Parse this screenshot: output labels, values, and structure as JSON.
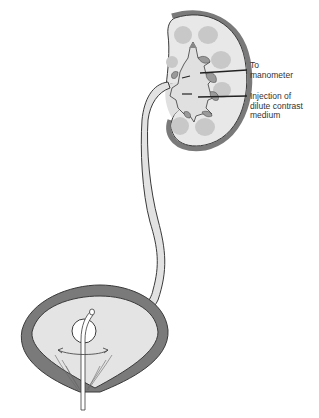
{
  "diagram": {
    "type": "anatomical-illustration",
    "labels": [
      {
        "id": "to-manometer",
        "text": "To\nmanometer"
      },
      {
        "id": "injection",
        "text": "Injection of\ndilute contrast\nmedium"
      }
    ],
    "colors": {
      "outline": "#3a3a3a",
      "tissue_light": "#e4e4e4",
      "tissue_mid": "#bdbdbd",
      "wall_dark": "#7a7a7a",
      "background": "#ffffff"
    }
  }
}
